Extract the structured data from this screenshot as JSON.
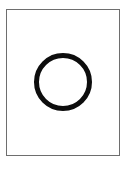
{
  "canvas": {
    "width": 128,
    "height": 169,
    "background_color": "#ffffff"
  },
  "frame": {
    "name": "bordered-panel",
    "x": 6,
    "y": 9,
    "width": 114,
    "height": 147,
    "border_width": 1,
    "border_color": "#6e6e6e",
    "fill_color": "#ffffff"
  },
  "shapes": [
    {
      "name": "circle-outline",
      "type": "circle",
      "cx": 63,
      "cy": 82,
      "r": 26.5,
      "stroke_color": "#0d0d0d",
      "stroke_width": 5,
      "fill": "none"
    }
  ],
  "caption": {
    "text": ""
  }
}
